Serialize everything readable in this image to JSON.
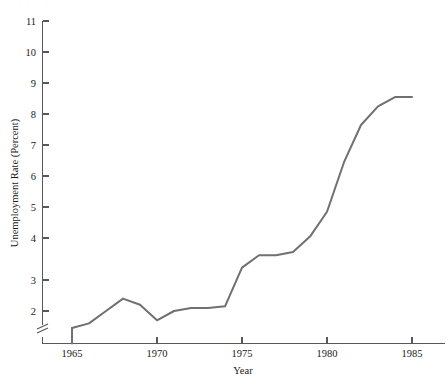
{
  "page": {
    "header_artifact_text": "· · ·   ·   ·  ·   ·   ·"
  },
  "chart_data": {
    "type": "line",
    "title": "",
    "xlabel": "Year",
    "ylabel": "Unemployment Rate (Percent)",
    "x": [
      1965,
      1966,
      1967,
      1968,
      1969,
      1970,
      1971,
      1972,
      1973,
      1974,
      1975,
      1976,
      1977,
      1978,
      1979,
      1980,
      1981,
      1982,
      1983,
      1984,
      1985
    ],
    "values": [
      1.45,
      1.6,
      2.0,
      2.4,
      2.2,
      1.7,
      2.0,
      2.1,
      2.1,
      2.15,
      3.4,
      3.8,
      3.8,
      3.9,
      4.4,
      5.2,
      6.8,
      8.0,
      8.6,
      8.9,
      8.9
    ],
    "series": [
      {
        "name": "Unemployment Rate",
        "color": "#6f6f74",
        "values": [
          1.45,
          1.6,
          2.0,
          2.4,
          2.2,
          1.7,
          2.0,
          2.1,
          2.1,
          2.15,
          3.4,
          3.8,
          3.8,
          3.9,
          4.4,
          5.2,
          6.8,
          8.0,
          8.6,
          8.9,
          8.9
        ]
      }
    ],
    "xlim": [
      1964.3,
      1986.0
    ],
    "ylim": [
      1.35,
      11.0
    ],
    "xticks": [
      1965,
      1970,
      1975,
      1980,
      1985
    ],
    "xtick_labels": [
      "1965",
      "1970",
      "1975",
      "1980",
      "1985"
    ],
    "yticks": [
      2,
      3,
      4,
      5,
      6,
      7,
      8,
      9,
      10,
      11
    ],
    "ytick_labels": [
      "2",
      "3",
      "4",
      "5",
      "6",
      "7",
      "8",
      "9",
      "10",
      "11"
    ],
    "y_axis_break": true,
    "y_axis_break_symbol": "≈",
    "grid": false,
    "legend": false,
    "legend_position": "none"
  }
}
